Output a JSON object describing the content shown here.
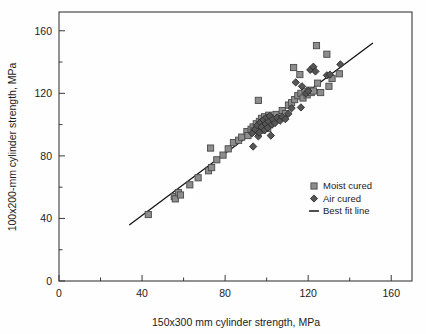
{
  "chart_data": {
    "type": "scatter",
    "title": "",
    "xlabel": "150x300 mm cylinder strength, MPa",
    "ylabel": "100x200-mm cylinder strength, MPa",
    "xlim": [
      0,
      170
    ],
    "ylim": [
      0,
      172
    ],
    "xticks": [
      0,
      40,
      80,
      120,
      160
    ],
    "yticks": [
      0,
      40,
      80,
      120,
      160
    ],
    "xticklabels": [
      "0",
      "40",
      "80",
      "120",
      "160"
    ],
    "yticklabels": [
      "0",
      "40",
      "80",
      "120",
      "160"
    ],
    "xminorticks": [
      20,
      60,
      100,
      140
    ],
    "yminorticks": [
      20,
      60,
      100,
      140
    ],
    "grid": false,
    "legend_position": "center-right",
    "legend": [
      {
        "label": "Moist cured",
        "marker": "square",
        "color": "#8d8d8d"
      },
      {
        "label": "Air cured",
        "marker": "diamond",
        "color": "#565656"
      },
      {
        "label": "Best fit line",
        "marker": "line",
        "color": "#141414"
      }
    ],
    "series": [
      {
        "name": "Moist cured",
        "marker": "square",
        "color": "#8d8d8d",
        "points": [
          [
            43.0,
            42.5
          ],
          [
            55.5,
            54.0
          ],
          [
            56.0,
            52.5
          ],
          [
            57.5,
            56.5
          ],
          [
            58.5,
            55.0
          ],
          [
            63.0,
            61.5
          ],
          [
            67.0,
            66.0
          ],
          [
            72.0,
            70.5
          ],
          [
            73.5,
            72.5
          ],
          [
            73.0,
            85.0
          ],
          [
            76.0,
            77.5
          ],
          [
            79.0,
            80.5
          ],
          [
            81.5,
            84.5
          ],
          [
            84.0,
            88.5
          ],
          [
            86.5,
            90.0
          ],
          [
            88.0,
            92.0
          ],
          [
            90.5,
            95.5
          ],
          [
            91.0,
            93.0
          ],
          [
            92.5,
            97.0
          ],
          [
            93.5,
            98.5
          ],
          [
            94.0,
            96.0
          ],
          [
            95.0,
            100.5
          ],
          [
            95.5,
            98.0
          ],
          [
            96.5,
            102.0
          ],
          [
            97.0,
            99.5
          ],
          [
            97.5,
            104.0
          ],
          [
            98.0,
            96.5
          ],
          [
            98.5,
            101.0
          ],
          [
            99.0,
            105.0
          ],
          [
            99.5,
            99.0
          ],
          [
            100.0,
            103.5
          ],
          [
            100.5,
            97.5
          ],
          [
            101.0,
            106.0
          ],
          [
            101.5,
            100.0
          ],
          [
            102.0,
            104.5
          ],
          [
            96.0,
            115.5
          ],
          [
            103.0,
            102.5
          ],
          [
            104.5,
            106.5
          ],
          [
            106.0,
            104.0
          ],
          [
            107.5,
            109.0
          ],
          [
            109.0,
            107.0
          ],
          [
            110.5,
            112.5
          ],
          [
            112.0,
            114.0
          ],
          [
            113.5,
            116.0
          ],
          [
            115.0,
            118.5
          ],
          [
            116.5,
            120.0
          ],
          [
            117.5,
            117.0
          ],
          [
            118.5,
            121.0
          ],
          [
            119.5,
            119.0
          ],
          [
            120.5,
            122.0
          ],
          [
            121.5,
            120.5
          ],
          [
            122.5,
            121.5
          ],
          [
            124.0,
            150.5
          ],
          [
            129.0,
            145.0
          ],
          [
            124.5,
            126.5
          ],
          [
            126.0,
            120.5
          ],
          [
            130.0,
            124.5
          ],
          [
            131.5,
            129.5
          ],
          [
            135.0,
            132.5
          ],
          [
            116.0,
            132.0
          ],
          [
            113.0,
            136.5
          ]
        ]
      },
      {
        "name": "Air cured",
        "marker": "diamond",
        "color": "#565656",
        "points": [
          [
            93.5,
            86.0
          ],
          [
            96.0,
            92.5
          ],
          [
            93.0,
            94.5
          ],
          [
            94.5,
            97.0
          ],
          [
            95.5,
            99.5
          ],
          [
            96.5,
            95.0
          ],
          [
            97.0,
            101.5
          ],
          [
            97.5,
            98.5
          ],
          [
            98.5,
            103.0
          ],
          [
            99.0,
            96.5
          ],
          [
            99.5,
            100.5
          ],
          [
            100.0,
            104.5
          ],
          [
            100.5,
            98.0
          ],
          [
            101.0,
            102.0
          ],
          [
            101.5,
            105.5
          ],
          [
            102.5,
            100.0
          ],
          [
            103.0,
            103.5
          ],
          [
            104.0,
            101.0
          ],
          [
            105.0,
            104.5
          ],
          [
            102.0,
            93.0
          ],
          [
            106.5,
            102.5
          ],
          [
            107.5,
            105.0
          ],
          [
            109.0,
            103.5
          ],
          [
            110.5,
            107.0
          ],
          [
            112.0,
            110.5
          ],
          [
            114.0,
            127.0
          ],
          [
            117.0,
            124.5
          ],
          [
            119.0,
            120.0
          ],
          [
            120.0,
            121.5
          ],
          [
            121.0,
            135.0
          ],
          [
            122.5,
            137.0
          ],
          [
            123.5,
            134.0
          ],
          [
            129.0,
            131.5
          ],
          [
            130.5,
            132.0
          ],
          [
            135.5,
            138.5
          ],
          [
            116.5,
            111.0
          ]
        ]
      }
    ],
    "bestfit_line": {
      "name": "Best fit line",
      "x": [
        34.0,
        151.0
      ],
      "y": [
        36.0,
        152.0
      ]
    }
  }
}
